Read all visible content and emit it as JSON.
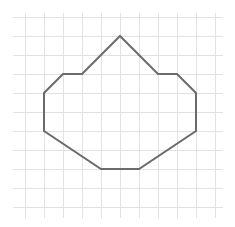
{
  "diagram": {
    "type": "polygon-on-grid",
    "grid": {
      "x_start": 13,
      "x_end": 223,
      "y_start": 13,
      "y_end": 218,
      "vertical_lines": [
        25,
        44,
        63,
        82,
        101,
        120,
        139,
        158,
        177,
        196,
        215
      ],
      "horizontal_lines": [
        17,
        36,
        55,
        74,
        93,
        112,
        131,
        150,
        169,
        188,
        207
      ],
      "color": "#e2e2e2"
    },
    "polygon": {
      "stroke": "#6b6b6b",
      "stroke_width": 2,
      "points": [
        [
          120,
          36
        ],
        [
          158,
          74
        ],
        [
          177,
          74
        ],
        [
          196,
          93
        ],
        [
          196,
          131
        ],
        [
          139,
          169
        ],
        [
          101,
          169
        ],
        [
          44,
          131
        ],
        [
          44,
          93
        ],
        [
          63,
          74
        ],
        [
          82,
          74
        ]
      ]
    }
  }
}
